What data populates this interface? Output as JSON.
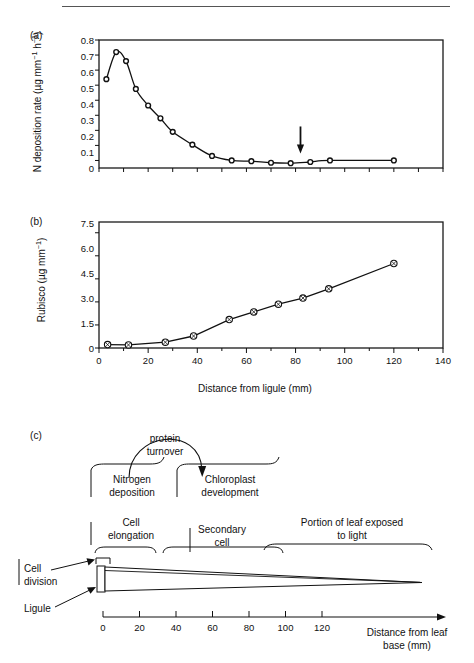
{
  "figure": {
    "panels": [
      {
        "letter": "(a)"
      },
      {
        "letter": "(b)"
      },
      {
        "letter": "(c)"
      }
    ]
  },
  "chart_data": [
    {
      "panel": "(a)",
      "type": "line",
      "title": "",
      "xlabel": "",
      "ylabel": "N deposition rate (µg mm⁻¹ h⁻¹)",
      "ylabel_plain": "N deposition rate (ug mm-1 h-1)",
      "xlim": [
        0,
        140
      ],
      "ylim": [
        -0.05,
        0.8
      ],
      "yticks": [
        0,
        0.1,
        0.2,
        0.3,
        0.4,
        0.5,
        0.6,
        0.7,
        0.8
      ],
      "ytick_labels": [
        "0",
        "0.1",
        "0.2",
        "0.3",
        "0.4",
        "0.5",
        "0.6",
        "0.7",
        "0.8"
      ],
      "xticks": [
        0,
        10,
        20,
        30,
        40,
        50,
        60,
        70,
        80,
        90,
        100,
        110,
        120,
        130,
        140
      ],
      "xtick_labels": [],
      "grid": false,
      "legend": "none",
      "marker": "open-circle",
      "annotations": [
        {
          "kind": "arrow-down",
          "x": 82,
          "y": 0.0,
          "label": ""
        }
      ],
      "x": [
        3,
        7,
        11,
        15,
        20,
        25,
        30,
        38,
        46,
        54,
        62,
        70,
        78,
        86,
        94,
        120
      ],
      "values": [
        0.54,
        0.72,
        0.66,
        0.475,
        0.365,
        0.28,
        0.19,
        0.105,
        0.03,
        0.0,
        -0.005,
        -0.015,
        -0.018,
        -0.01,
        0.0,
        0.0
      ]
    },
    {
      "panel": "(b)",
      "type": "line",
      "title": "",
      "xlabel": "Distance from ligule (mm)",
      "ylabel": "Rubisco (µg mm⁻¹)",
      "ylabel_plain": "Rubisco (ug mm-1)",
      "xlim": [
        0,
        140
      ],
      "ylim": [
        0,
        8.2
      ],
      "yticks": [
        0,
        1.5,
        3.0,
        4.5,
        6.0,
        7.5
      ],
      "ytick_labels": [
        "0",
        "1.5",
        "3.0",
        "4.5",
        "6.0",
        "7.5"
      ],
      "xticks": [
        0,
        20,
        40,
        60,
        80,
        100,
        120,
        140
      ],
      "xtick_labels": [
        "0",
        "20",
        "40",
        "60",
        "80",
        "100",
        "120",
        "140"
      ],
      "grid": false,
      "legend": "none",
      "marker": "crossed-circle",
      "x": [
        3.5,
        12,
        27,
        38.5,
        53,
        63,
        73,
        83,
        93.5,
        120
      ],
      "values": [
        0.22,
        0.2,
        0.38,
        0.78,
        1.85,
        2.35,
        2.85,
        3.25,
        3.85,
        5.5
      ]
    }
  ],
  "panel_c": {
    "letter": "(c)",
    "protein_turnover": "protein\nturnover",
    "protein_turnover_line1": "protein",
    "protein_turnover_line2": "turnover",
    "nitrogen_deposition_line1": "Nitrogen",
    "nitrogen_deposition_line2": "deposition",
    "chloroplast_line1": "Chloroplast",
    "chloroplast_line2": "development",
    "cell_elongation_line1": "Cell",
    "cell_elongation_line2": "elongation",
    "secondary_cell_line1": "Secondary",
    "secondary_cell_line2": "cell",
    "portion_of_leaf_line1": "Portion of leaf exposed",
    "portion_of_leaf_line2": "to light",
    "cell_division_line1": "Cell",
    "cell_division_line2": "division",
    "ligule": "Ligule",
    "axis_label_line1": "Distance from leaf",
    "axis_label_line2": "base (mm)",
    "axis_ticks": [
      "0",
      "20",
      "40",
      "60",
      "80",
      "100",
      "120"
    ],
    "axis_tick_values": [
      0,
      20,
      40,
      60,
      80,
      100,
      120
    ]
  },
  "colors": {
    "ink": "#111111",
    "rule": "#555555",
    "background": "#ffffff"
  }
}
